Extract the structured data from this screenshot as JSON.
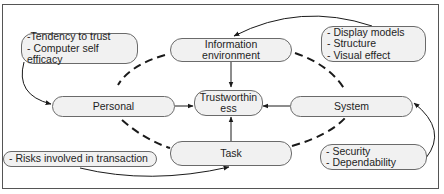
{
  "diagram": {
    "center": {
      "label_line1": "Trustworthin",
      "label_line2": "ess"
    },
    "factors": {
      "information_environment": {
        "line1": "Information",
        "line2": "environment"
      },
      "personal": {
        "label": "Personal"
      },
      "system": {
        "label": "System"
      },
      "task": {
        "label": "Task"
      }
    },
    "notes": {
      "personal": [
        "-Tendency to trust",
        "- Computer self efficacy"
      ],
      "information_environment": [
        "- Display models",
        "- Structure",
        "- Visual effect"
      ],
      "system": [
        "- Security",
        "- Dependability"
      ],
      "task": [
        "- Risks involved in transaction"
      ]
    },
    "colors": {
      "node_fill": "#f1f1f1",
      "node_border": "#6a6a6a",
      "line": "#1a1a1a"
    }
  }
}
